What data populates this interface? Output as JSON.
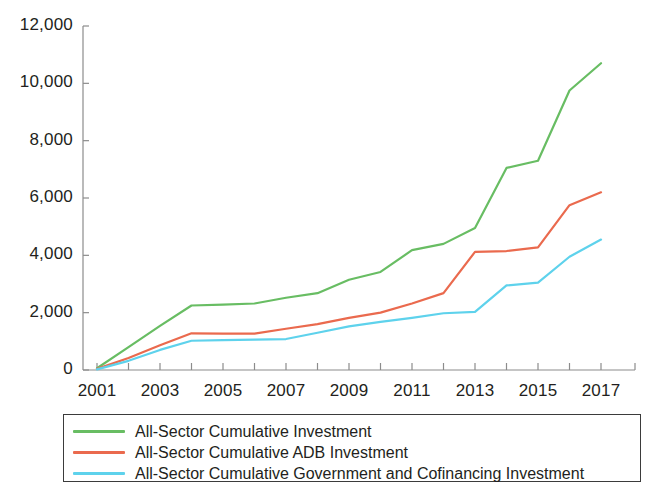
{
  "chart_data": {
    "type": "line",
    "title": "",
    "subtitle": "",
    "xlabel": "",
    "ylabel": "",
    "xlim": [
      2001,
      2017
    ],
    "ylim": [
      0,
      12000
    ],
    "grid": false,
    "legend_position": "bottom",
    "x": [
      2001,
      2002,
      2003,
      2004,
      2005,
      2006,
      2007,
      2008,
      2009,
      2010,
      2011,
      2012,
      2013,
      2014,
      2015,
      2016,
      2017
    ],
    "xtick_labels": [
      "2001",
      "2003",
      "2005",
      "2007",
      "2009",
      "2011",
      "2013",
      "2015",
      "2017"
    ],
    "xtick_values": [
      2001,
      2003,
      2005,
      2007,
      2009,
      2011,
      2013,
      2015,
      2017
    ],
    "ytick_labels": [
      "0",
      "2,000",
      "4,000",
      "6,000",
      "8,000",
      "10,000",
      "12,000"
    ],
    "ytick_values": [
      0,
      2000,
      4000,
      6000,
      8000,
      10000,
      12000
    ],
    "series": [
      {
        "name": "All-Sector Cumulative Investment",
        "color": "#68bd63",
        "values": [
          60,
          800,
          1540,
          2250,
          2280,
          2320,
          2520,
          2680,
          3150,
          3420,
          4180,
          4400,
          4950,
          7050,
          7300,
          9750,
          10700
        ]
      },
      {
        "name": "All-Sector Cumulative ADB Investment",
        "color": "#ea6a4e",
        "values": [
          40,
          420,
          860,
          1280,
          1270,
          1270,
          1440,
          1600,
          1820,
          2000,
          2320,
          2680,
          4120,
          4150,
          4280,
          5750,
          6200
        ]
      },
      {
        "name": "All-Sector Cumulative Government and Cofinancing Investment",
        "color": "#5ed2ec",
        "values": [
          20,
          320,
          700,
          1020,
          1040,
          1060,
          1080,
          1300,
          1520,
          1680,
          1820,
          1980,
          2030,
          2950,
          3050,
          3950,
          4550
        ]
      }
    ]
  },
  "legend": {
    "items": [
      {
        "label": "All-Sector Cumulative Investment",
        "color": "#68bd63"
      },
      {
        "label": "All-Sector Cumulative ADB Investment",
        "color": "#ea6a4e"
      },
      {
        "label": "All-Sector Cumulative Government and Cofinancing Investment",
        "color": "#5ed2ec"
      }
    ]
  },
  "axes": {
    "axis_color": "#8c8c8c"
  }
}
